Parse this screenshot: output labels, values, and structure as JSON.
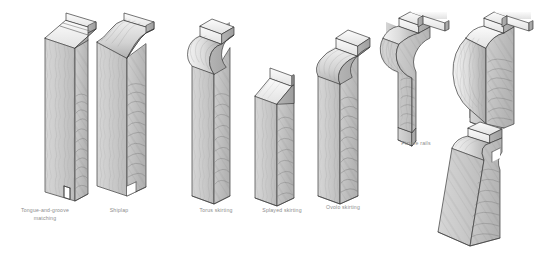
{
  "plate": {
    "title": "Timber moulding profiles",
    "background_color": "#ffffff",
    "caption_color": "#8c8c8c"
  },
  "palette": {
    "face_light": "#cfcfcf",
    "face_mid": "#bdbdbd",
    "face_dark": "#9a9a9a",
    "top_highlight": "#f2f2f2",
    "end_grain": "#c4c4c4",
    "outline": "#3a3a3a",
    "grain_line": "#6e6e6e",
    "shadow": "#888888"
  },
  "figures": [
    {
      "id": "tongue-and-groove-matching",
      "caption": "Tongue-and-groove\nmatching",
      "caption_x": 13,
      "caption_y": 206,
      "caption_w": 64,
      "group": "boards"
    },
    {
      "id": "shiplap",
      "caption": "Shiplap",
      "caption_x": 96,
      "caption_y": 206,
      "caption_w": 46,
      "group": "boards"
    },
    {
      "id": "torus-skirting",
      "caption": "Torus skirting",
      "caption_x": 188,
      "caption_y": 206,
      "caption_w": 56,
      "group": "skirtings"
    },
    {
      "id": "splayed-skirting",
      "caption": "Splayed skirting",
      "caption_x": 252,
      "caption_y": 206,
      "caption_w": 60,
      "group": "skirtings"
    },
    {
      "id": "ovolo-skirting",
      "caption": "Ovolo skirting",
      "caption_x": 314,
      "caption_y": 203,
      "caption_w": 58,
      "group": "skirtings"
    },
    {
      "id": "picture-rail-cavetto",
      "caption": "Picture rails",
      "caption_x": 392,
      "caption_y": 140,
      "caption_w": 48,
      "group": "picture-rails"
    },
    {
      "id": "picture-rail-bullnose",
      "caption": "",
      "caption_x": 0,
      "caption_y": 0,
      "caption_w": 0,
      "group": "picture-rails"
    },
    {
      "id": "picture-rail-rounded",
      "caption": "",
      "caption_x": 0,
      "caption_y": 0,
      "caption_w": 0,
      "group": "picture-rails"
    }
  ],
  "captions": {
    "tongue_and_groove": "Tongue-and-groove\nmatching",
    "shiplap": "Shiplap",
    "torus": "Torus skirting",
    "splayed": "Splayed skirting",
    "ovolo": "Ovolo skirting",
    "picture_rails": "Picture rails"
  }
}
